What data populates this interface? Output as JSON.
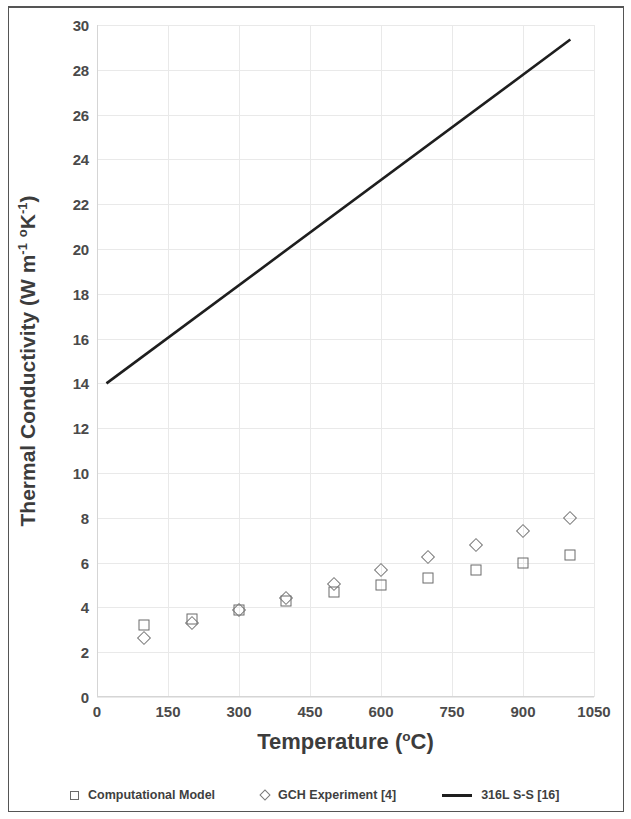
{
  "figure": {
    "y_axis_title_main": "Thermal Conductivity (W m",
    "y_axis_title_sup1": "-1",
    "y_axis_title_mid": " ",
    "y_axis_title_sup_o": "o",
    "y_axis_title_k": "K",
    "y_axis_title_sup2": "-1",
    "y_axis_title_end": ")",
    "x_axis_title_main": "Temperature (",
    "x_axis_title_sup": "o",
    "x_axis_title_end": "C)"
  },
  "legend": {
    "items": [
      {
        "label": "Computational Model",
        "marker": "square-icon",
        "color": "#6b6b6b"
      },
      {
        "label": "GCH Experiment [4]",
        "marker": "diamond-icon",
        "color": "#7a7a7a"
      },
      {
        "label": "316L S-S [16]",
        "marker": "line-icon",
        "color": "#1e1e1e"
      }
    ]
  },
  "chart_data": {
    "type": "scatter",
    "title": "",
    "xlabel": "Temperature (oC)",
    "ylabel": "Thermal Conductivity (W m-1 oK-1)",
    "xlim": [
      0,
      1050
    ],
    "ylim": [
      0,
      30
    ],
    "xticks": [
      0,
      150,
      300,
      450,
      600,
      750,
      900,
      1050
    ],
    "yticks": [
      0,
      2,
      4,
      6,
      8,
      10,
      12,
      14,
      16,
      18,
      20,
      22,
      24,
      26,
      28,
      30
    ],
    "grid": true,
    "legend_position": "bottom",
    "series": [
      {
        "name": "Computational Model",
        "type": "scatter",
        "marker": "open-square",
        "color": "#6b6b6b",
        "x": [
          100,
          200,
          300,
          400,
          500,
          600,
          700,
          800,
          900,
          1000
        ],
        "values": [
          3.2,
          3.5,
          3.9,
          4.3,
          4.7,
          5.0,
          5.3,
          5.65,
          6.0,
          6.35
        ]
      },
      {
        "name": "GCH Experiment [4]",
        "type": "scatter",
        "marker": "open-diamond",
        "color": "#7a7a7a",
        "x": [
          100,
          200,
          300,
          400,
          500,
          600,
          700,
          800,
          900,
          1000
        ],
        "values": [
          2.65,
          3.3,
          3.9,
          4.4,
          5.05,
          5.65,
          6.25,
          6.8,
          7.4,
          8.0
        ]
      },
      {
        "name": "316L S-S [16]",
        "type": "line",
        "marker": "none",
        "color": "#1e1e1e",
        "x": [
          20,
          1000
        ],
        "values": [
          14.0,
          29.35
        ]
      }
    ]
  }
}
